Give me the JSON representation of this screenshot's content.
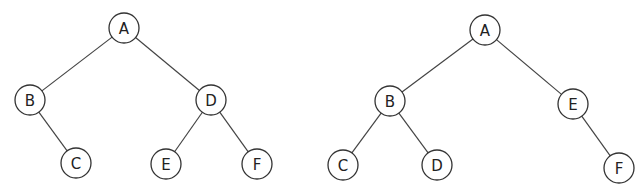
{
  "diagram": {
    "node_radius": 15,
    "trees": [
      {
        "name": "tree-left",
        "nodes": [
          {
            "id": "A",
            "label": "A",
            "x": 124,
            "y": 28
          },
          {
            "id": "B",
            "label": "B",
            "x": 30,
            "y": 100
          },
          {
            "id": "D",
            "label": "D",
            "x": 211,
            "y": 100
          },
          {
            "id": "C",
            "label": "C",
            "x": 76,
            "y": 163
          },
          {
            "id": "E",
            "label": "E",
            "x": 166,
            "y": 164
          },
          {
            "id": "F",
            "label": "F",
            "x": 257,
            "y": 164
          }
        ],
        "edges": [
          [
            "A",
            "B"
          ],
          [
            "A",
            "D"
          ],
          [
            "B",
            "C"
          ],
          [
            "D",
            "E"
          ],
          [
            "D",
            "F"
          ]
        ]
      },
      {
        "name": "tree-right",
        "nodes": [
          {
            "id": "A",
            "label": "A",
            "x": 485,
            "y": 30
          },
          {
            "id": "B",
            "label": "B",
            "x": 390,
            "y": 101
          },
          {
            "id": "E",
            "label": "E",
            "x": 573,
            "y": 104
          },
          {
            "id": "C",
            "label": "C",
            "x": 343,
            "y": 165
          },
          {
            "id": "D",
            "label": "D",
            "x": 437,
            "y": 165
          },
          {
            "id": "F",
            "label": "F",
            "x": 619,
            "y": 168
          }
        ],
        "edges": [
          [
            "A",
            "B"
          ],
          [
            "A",
            "E"
          ],
          [
            "B",
            "C"
          ],
          [
            "B",
            "D"
          ],
          [
            "E",
            "F"
          ]
        ]
      }
    ]
  }
}
